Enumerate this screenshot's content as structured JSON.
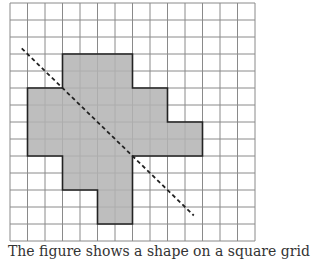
{
  "diagram": {
    "type": "grid-shape-with-symmetry-line",
    "grid": {
      "columns": 14,
      "rows": 14,
      "origin_x": 10,
      "origin_y": 3,
      "cell_w": 17.5,
      "cell_h": 17,
      "line_color": "#8a8a8a"
    },
    "shape": {
      "fill": "#b3b3b3",
      "stroke": "#222222",
      "filled_rows": [
        {
          "rows": [
            3,
            4
          ],
          "cols": [
            3,
            6
          ]
        },
        {
          "rows": [
            5,
            6
          ],
          "cols": [
            1,
            8
          ]
        },
        {
          "rows": [
            7,
            8
          ],
          "cols": [
            1,
            10
          ]
        },
        {
          "rows": [
            9,
            10
          ],
          "cols": [
            3,
            6
          ]
        },
        {
          "rows": [
            11,
            12
          ],
          "cols": [
            5,
            6
          ]
        }
      ],
      "outline": [
        [
          3,
          3
        ],
        [
          7,
          3
        ],
        [
          7,
          5
        ],
        [
          9,
          5
        ],
        [
          9,
          7
        ],
        [
          11,
          7
        ],
        [
          11,
          9
        ],
        [
          7,
          9
        ],
        [
          7,
          11
        ],
        [
          7,
          13
        ],
        [
          5,
          13
        ],
        [
          5,
          11
        ],
        [
          3,
          11
        ],
        [
          3,
          9
        ],
        [
          1,
          9
        ],
        [
          1,
          5
        ],
        [
          3,
          5
        ],
        [
          3,
          3
        ]
      ]
    },
    "dashed_line": {
      "from": [
        0.67,
        2.67
      ],
      "to": [
        10.5,
        12.5
      ],
      "color": "#222222",
      "dash": "4 3"
    }
  },
  "caption": {
    "text": "The figure shows a shape on a square grid"
  }
}
